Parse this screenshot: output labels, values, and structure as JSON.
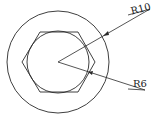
{
  "diagram": {
    "type": "technical-drawing",
    "stroke_color": "#2a2a2a",
    "background": "#ffffff",
    "labels": {
      "outer_radius": "R10",
      "inner_radius": "R6"
    },
    "shapes": {
      "outer_circle": {
        "cx": 58,
        "cy": 62,
        "r": 51
      },
      "inner_circle": {
        "cx": 58,
        "cy": 62,
        "r": 31
      },
      "hexagon": {
        "points": "22,62 40,32 78,32 95,62 78,92 40,92"
      }
    }
  }
}
